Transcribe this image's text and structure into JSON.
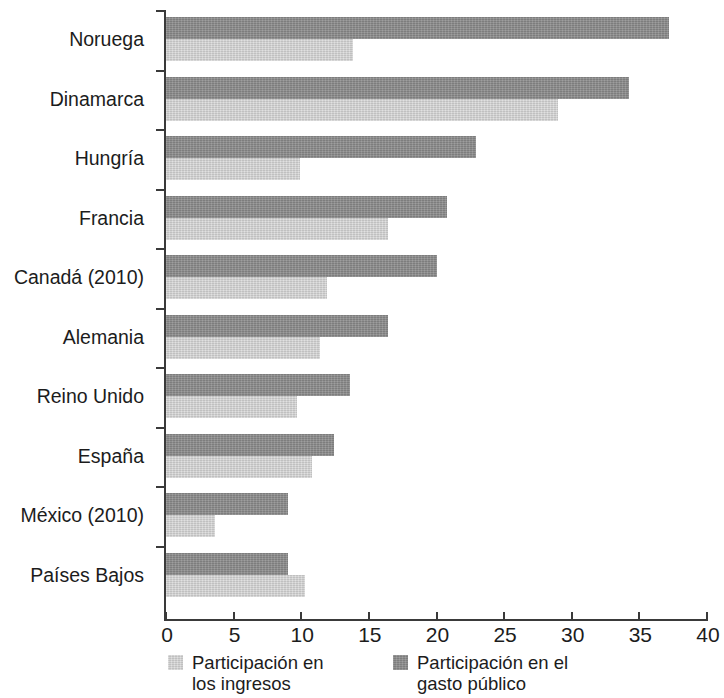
{
  "chart_data": {
    "type": "bar",
    "orientation": "horizontal",
    "title": "",
    "subtitle": "",
    "xlabel": "",
    "ylabel": "",
    "xlim": [
      0,
      40
    ],
    "ylim": null,
    "grid": false,
    "legend_position": "bottom",
    "xticks": [
      "0",
      "5",
      "10",
      "15",
      "20",
      "25",
      "30",
      "35",
      "40"
    ],
    "xtick_values": [
      0,
      5,
      10,
      15,
      20,
      25,
      30,
      35,
      40
    ],
    "categories": [
      "Noruega",
      "Dinamarca",
      "Hungría",
      "Francia",
      "Canadá (2010)",
      "Alemania",
      "Reino Unido",
      "España",
      "México (2010)",
      "Países Bajos"
    ],
    "series": [
      {
        "name": "Participación en el gasto público",
        "color": "#8a8a8a",
        "values": [
          37.2,
          34.2,
          22.9,
          20.8,
          20.0,
          16.4,
          13.6,
          12.4,
          9.0,
          9.0
        ]
      },
      {
        "name": "Participación en los ingresos",
        "color": "#cfcfcf",
        "values": [
          13.8,
          29.0,
          9.9,
          16.4,
          11.9,
          11.4,
          9.7,
          10.8,
          3.6,
          10.3
        ]
      }
    ],
    "legend": [
      {
        "label": "Participación en\nlos ingresos",
        "swatch": "light"
      },
      {
        "label": "Participación en el\ngasto público",
        "swatch": "dark"
      }
    ]
  },
  "colors": {
    "dark_bar": "#8a8a8a",
    "light_bar": "#cfcfcf",
    "axis": "#3a3a3a",
    "text": "#1c1c1c",
    "background": "#ffffff"
  }
}
